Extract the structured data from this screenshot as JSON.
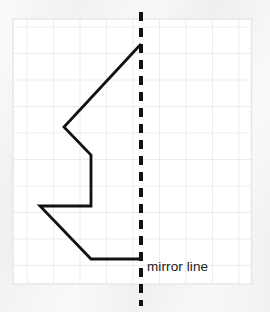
{
  "diagram": {
    "title_text": "",
    "label": "mirror line",
    "background_color": "#f2f2f1",
    "grid": {
      "name": "square-grid",
      "cell_color": "#ffffff",
      "line_color": "#e3e3e3",
      "x_start": 13,
      "y_start": 19,
      "cell_size": 26.5,
      "cols": 9,
      "rows": 10
    },
    "mirror_line": {
      "name": "mirror-line",
      "orientation": "vertical",
      "x": 141,
      "y_start": 12,
      "y_end": 306,
      "style": "dashed",
      "color": "#111111",
      "width": 4,
      "dash": "9 7"
    },
    "shape": {
      "name": "polyline-shape",
      "color": "#111111",
      "stroke_width": 2.8,
      "closed": false,
      "points": "141,44 64,127 91,155 91,206 40,206 91,259 141,259",
      "vertices": [
        {
          "x": 141,
          "y": 44
        },
        {
          "x": 64,
          "y": 127
        },
        {
          "x": 91,
          "y": 155
        },
        {
          "x": 91,
          "y": 206
        },
        {
          "x": 40,
          "y": 206
        },
        {
          "x": 91,
          "y": 259
        },
        {
          "x": 141,
          "y": 259
        }
      ]
    }
  }
}
